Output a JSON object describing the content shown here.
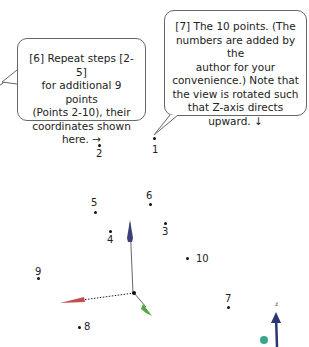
{
  "callouts": {
    "step6": {
      "lines": [
        "[6] Repeat steps [2-5]",
        "for additional 9 points",
        "(Points 2-10), their",
        "coordinates shown",
        "here. →"
      ]
    },
    "step7": {
      "lines": [
        "[7] The 10 points. (The",
        "numbers are added by the",
        "author for your",
        "convenience.) Note that",
        "the view is rotated such",
        "that Z-axis directs",
        "upward. ↓"
      ]
    }
  },
  "points": [
    {
      "label": "1",
      "x": 154,
      "y": 139
    },
    {
      "label": "2",
      "x": 99,
      "y": 146
    },
    {
      "label": "3",
      "x": 165,
      "y": 223
    },
    {
      "label": "4",
      "x": 110,
      "y": 231
    },
    {
      "label": "5",
      "x": 95,
      "y": 212
    },
    {
      "label": "6",
      "x": 150,
      "y": 204
    },
    {
      "label": "7",
      "x": 228,
      "y": 307
    },
    {
      "label": "8",
      "x": 79,
      "y": 327
    },
    {
      "label": "9",
      "x": 38,
      "y": 278
    },
    {
      "label": "10",
      "x": 187,
      "y": 258
    }
  ],
  "axes": {
    "x_color": "#c0504d",
    "y_color": "#4fa83a",
    "z_color": "#3b3f7a"
  },
  "orientation_widget": {
    "label": "z",
    "sphere_color": "#3aa58c",
    "arrow_color": "#2d3570"
  }
}
